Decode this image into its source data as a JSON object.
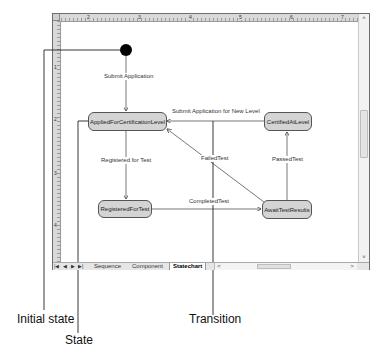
{
  "window": {
    "ruler_top_numbers": [
      "2",
      "3",
      "4",
      "5",
      "6",
      "7"
    ],
    "ruler_left_numbers": [
      "1",
      "2",
      "3",
      "4"
    ]
  },
  "diagram": {
    "initial_state": {
      "name": "initial-state"
    },
    "states": [
      {
        "id": "applied",
        "label": "AppliedForCertificationLevel"
      },
      {
        "id": "certified",
        "label": "CertifiedAtLevel"
      },
      {
        "id": "registered",
        "label": "RegisteredForTest"
      },
      {
        "id": "await",
        "label": "AwaitTestResults"
      }
    ],
    "transitions": [
      {
        "from": "initial",
        "to": "applied",
        "label": "Submit Application"
      },
      {
        "from": "certified",
        "to": "applied",
        "label": "Submit Application for New Level"
      },
      {
        "from": "applied",
        "to": "registered",
        "label": "Registered for Test"
      },
      {
        "from": "registered",
        "to": "await",
        "label": "CompletedTest"
      },
      {
        "from": "await",
        "to": "applied",
        "label": "FailedTest"
      },
      {
        "from": "await",
        "to": "certified",
        "label": "PassedTest"
      }
    ]
  },
  "tabs": {
    "nav": [
      "|◀",
      "◀",
      "▶",
      "▶|"
    ],
    "items": [
      {
        "label": "Sequence",
        "active": false
      },
      {
        "label": "Component",
        "active": false
      },
      {
        "label": "Statechart",
        "active": true
      }
    ]
  },
  "scrollbars": {
    "up": "˄",
    "down": "˅",
    "left": "<",
    "right": ">"
  },
  "callouts": {
    "initial_state": "Initial state",
    "state": "State",
    "transition": "Transition"
  }
}
